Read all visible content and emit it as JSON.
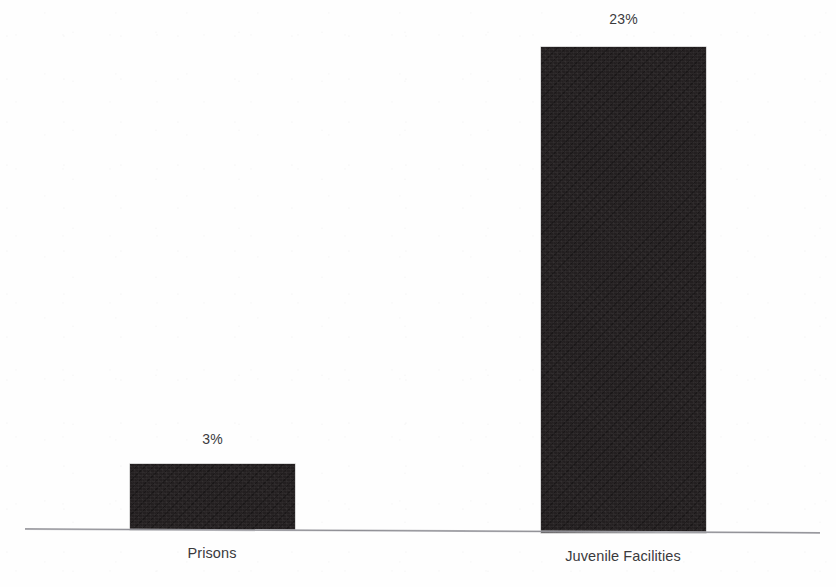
{
  "chart_data": {
    "type": "bar",
    "title": "",
    "subtitle": "",
    "xlabel": "",
    "ylabel": "",
    "categories": [
      "Prisons",
      "Juvenile Facilities"
    ],
    "values": [
      3,
      23
    ],
    "value_labels": [
      "3%",
      "23%"
    ],
    "units": "percent",
    "ylim": [
      0,
      23
    ],
    "grid": false,
    "legend": null,
    "legend_position": "none",
    "axis": {
      "baseline_visible": true,
      "y_axis_visible": false,
      "y_ticks": [],
      "x_ticks": [
        "Prisons",
        "Juvenile Facilities"
      ]
    },
    "series": [
      {
        "name": "",
        "values": [
          3,
          23
        ],
        "color": "#231f20"
      }
    ],
    "bars": [
      {
        "category": "Prisons",
        "value": 3,
        "value_label": "3%",
        "color": "#231f20"
      },
      {
        "category": "Juvenile Facilities",
        "value": 23,
        "value_label": "23%",
        "color": "#231f20"
      }
    ]
  },
  "colors": {
    "bar_fill": "#231f20",
    "axis_line": "#8d8d93",
    "label_text": "#3a3a3d",
    "background": "#fefefe"
  }
}
